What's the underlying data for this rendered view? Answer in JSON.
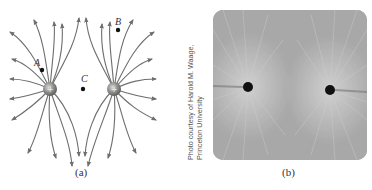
{
  "figure": {
    "panel_a": {
      "caption": "(a)",
      "charges": [
        {
          "id": "left",
          "sign": "+",
          "cx": 50,
          "cy": 89
        },
        {
          "id": "right",
          "sign": "+",
          "cx": 114,
          "cy": 89
        }
      ],
      "points": [
        {
          "label": "A",
          "dot_x": 42,
          "dot_y": 70
        },
        {
          "label": "B",
          "dot_x": 118,
          "dot_y": 30
        },
        {
          "label": "C",
          "dot_x": 83,
          "dot_y": 89
        }
      ],
      "line_color": "#6e6e6e",
      "charge_color": "#8a8a8a"
    },
    "panel_b": {
      "caption": "(b)",
      "credit_line1": "Photo courtesy of Harold M. Waage,",
      "credit_line2": "Princeton University",
      "charges": [
        {
          "cx": 248,
          "cy": 87
        },
        {
          "cx": 330,
          "cy": 90
        }
      ]
    }
  }
}
